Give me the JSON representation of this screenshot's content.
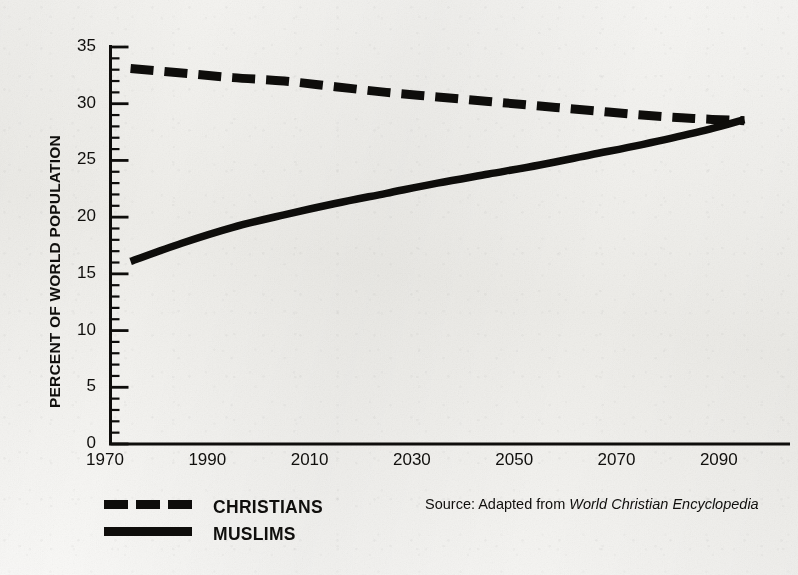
{
  "chart_data": {
    "type": "line",
    "title": "",
    "subtitle": "",
    "xlabel": "",
    "ylabel": "PERCENT OF WORLD POPULATION",
    "xlim": [
      1970,
      2100
    ],
    "ylim": [
      0,
      35
    ],
    "grid": false,
    "legend_position": "bottom-left",
    "x_tick_labels": [
      "1970",
      "1990",
      "2010",
      "2030",
      "2050",
      "2070",
      "2090"
    ],
    "x_ticks": [
      1970,
      1990,
      2010,
      2030,
      2050,
      2070,
      2090
    ],
    "y_tick_labels": [
      "35",
      "30",
      "25",
      "20",
      "15",
      "10",
      "5",
      "0"
    ],
    "y_ticks": [
      35,
      30,
      25,
      20,
      15,
      10,
      5,
      0
    ],
    "y_minor_tick_step": 1,
    "annotations": [
      "Source: Adapted from World Christian Encyclopedia"
    ],
    "x": [
      1975,
      1985,
      1995,
      2005,
      2015,
      2025,
      2035,
      2045,
      2055,
      2065,
      2075,
      2085,
      2095
    ],
    "series": [
      {
        "name": "CHRISTIANS",
        "style": "dashed",
        "color": "#0e0d0b",
        "values": [
          33.1,
          32.7,
          32.3,
          32.0,
          31.5,
          31.0,
          30.6,
          30.2,
          29.8,
          29.4,
          29.0,
          28.7,
          28.5
        ]
      },
      {
        "name": "MUSLIMS",
        "style": "solid",
        "color": "#0e0d0b",
        "values": [
          16.1,
          17.7,
          19.1,
          20.2,
          21.2,
          22.1,
          23.0,
          23.8,
          24.6,
          25.5,
          26.4,
          27.4,
          28.6
        ]
      }
    ]
  },
  "axes": {
    "y_title": "PERCENT OF WORLD POPULATION",
    "y_labels": [
      "35",
      "30",
      "25",
      "20",
      "15",
      "10",
      "5",
      "0"
    ],
    "x_labels": [
      "1970",
      "1990",
      "2010",
      "2030",
      "2050",
      "2070",
      "2090"
    ]
  },
  "legend": {
    "items": [
      {
        "label": "CHRISTIANS",
        "style": "dashed"
      },
      {
        "label": "MUSLIMS",
        "style": "solid"
      }
    ]
  },
  "source": {
    "prefix": "Source: Adapted from ",
    "publication": "World Christian Encyclopedia"
  },
  "colors": {
    "ink": "#0e0d0b",
    "paper": "#f2f1ed"
  }
}
